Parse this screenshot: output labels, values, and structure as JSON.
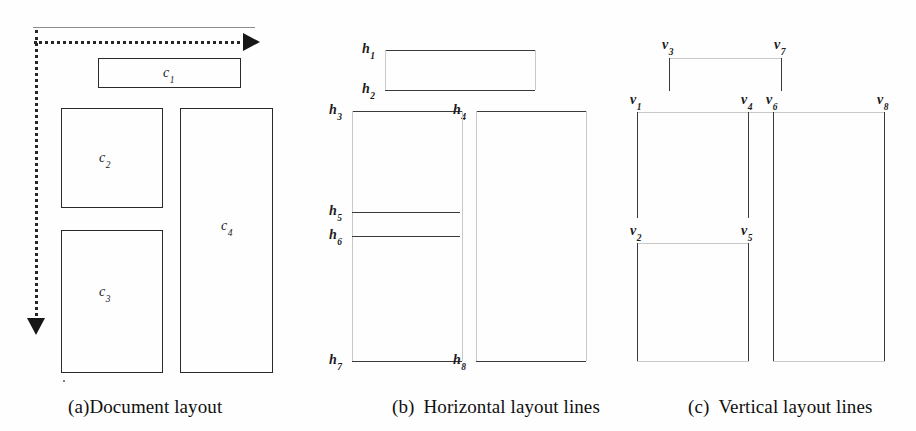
{
  "figure": {
    "background_color": "#fefefe",
    "line_color": "#3a3a3a",
    "arrow_color": "#161616"
  },
  "panel_a": {
    "caption_tag": "(a)",
    "caption_text": "Document layout",
    "reading_order_arrow": {
      "style": "dotted",
      "horizontal_direction": "right",
      "vertical_direction": "down"
    },
    "blocks": [
      {
        "label": "c",
        "subscript": "1",
        "name": "block-c1"
      },
      {
        "label": "c",
        "subscript": "2",
        "name": "block-c2"
      },
      {
        "label": "c",
        "subscript": "3",
        "name": "block-c3"
      },
      {
        "label": "c",
        "subscript": "4",
        "name": "block-c4"
      }
    ]
  },
  "panel_b": {
    "caption_tag": "(b)",
    "caption_text": "Horizontal layout lines",
    "lines": [
      {
        "label": "h",
        "subscript": "1"
      },
      {
        "label": "h",
        "subscript": "2"
      },
      {
        "label": "h",
        "subscript": "3"
      },
      {
        "label": "h",
        "subscript": "4"
      },
      {
        "label": "h",
        "subscript": "5"
      },
      {
        "label": "h",
        "subscript": "6"
      },
      {
        "label": "h",
        "subscript": "7"
      },
      {
        "label": "h",
        "subscript": "8"
      }
    ]
  },
  "panel_c": {
    "caption_tag": "(c)",
    "caption_text": "Vertical layout lines",
    "lines": [
      {
        "label": "v",
        "subscript": "1"
      },
      {
        "label": "v",
        "subscript": "2"
      },
      {
        "label": "v",
        "subscript": "3"
      },
      {
        "label": "v",
        "subscript": "4"
      },
      {
        "label": "v",
        "subscript": "5"
      },
      {
        "label": "v",
        "subscript": "6"
      },
      {
        "label": "v",
        "subscript": "7"
      },
      {
        "label": "v",
        "subscript": "8"
      }
    ]
  }
}
